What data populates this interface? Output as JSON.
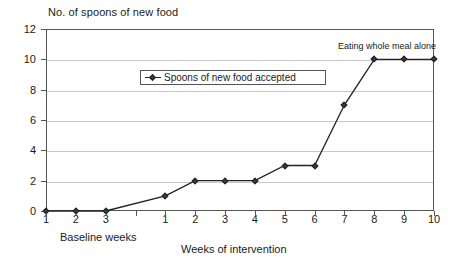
{
  "chart_data": {
    "type": "line",
    "title": "No. of spoons of new food",
    "xlabel": "Weeks of intervention",
    "secondary_xlabel": "Baseline weeks",
    "ylabel": "",
    "ylim": [
      0,
      12
    ],
    "ytick_labels": [
      "0",
      "2",
      "4",
      "6",
      "8",
      "10",
      "12"
    ],
    "ytick_values": [
      0,
      2,
      4,
      6,
      8,
      10,
      12
    ],
    "grid": true,
    "legend_position": "inside-upper-left",
    "legend": [
      "Spoons of new food accepted"
    ],
    "phases": [
      {
        "name": "Baseline weeks",
        "categories": [
          "1",
          "2",
          "3"
        ],
        "values": [
          0,
          0,
          0
        ]
      },
      {
        "name": "Weeks of intervention",
        "categories": [
          "1",
          "2",
          "3",
          "4",
          "5",
          "6",
          "7",
          "8",
          "9",
          "10"
        ],
        "values": [
          1,
          2,
          2,
          2,
          3,
          3,
          7,
          10,
          10,
          10
        ]
      }
    ],
    "annotations": [
      {
        "text": "Eating whole meal alone",
        "at_phase": "intervention",
        "at_x": "8",
        "at_y": 10
      }
    ],
    "series": [
      {
        "name": "Spoons of new food accepted",
        "marker": "diamond",
        "color": "#222222",
        "x": [
          "B1",
          "B2",
          "B3",
          "1",
          "2",
          "3",
          "4",
          "5",
          "6",
          "7",
          "8",
          "9",
          "10"
        ],
        "values": [
          0,
          0,
          0,
          1,
          2,
          2,
          2,
          3,
          3,
          7,
          10,
          10,
          10
        ]
      }
    ]
  },
  "colors": {
    "line": "#222222",
    "marker": "#3a3a3a",
    "grid": "#c9c9c9",
    "axis": "#555555",
    "background": "#ffffff"
  }
}
